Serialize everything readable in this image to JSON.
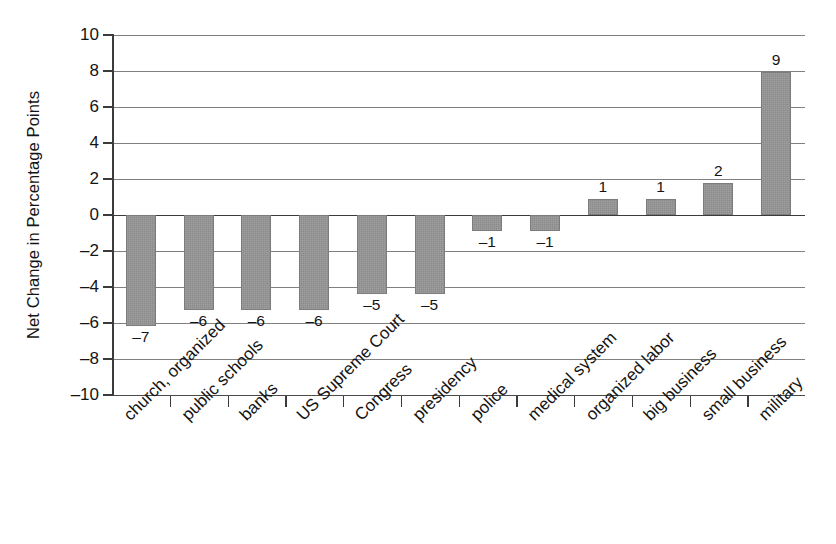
{
  "chart_data": {
    "type": "bar",
    "title": "",
    "xlabel": "",
    "ylabel": "Net Change in Percentage Points",
    "ylim": [
      -10,
      10
    ],
    "ytick_labels": [
      "10",
      "8",
      "6",
      "4",
      "2",
      "0",
      "–2",
      "–4",
      "–6",
      "–8",
      "–10"
    ],
    "ytick_values": [
      10,
      8,
      6,
      4,
      2,
      0,
      -2,
      -4,
      -6,
      -8,
      -10
    ],
    "grid": "horizontal",
    "legend": "none",
    "bar_color": "#8b8b8b",
    "categories": [
      "church, organized",
      "public schools",
      "banks",
      "US Supreme Court",
      "Congress",
      "presidency",
      "police",
      "medical system",
      "organized labor",
      "big business",
      "small business",
      "military"
    ],
    "values": [
      -7,
      -6,
      -6,
      -6,
      -5,
      -5,
      -1,
      -1,
      1,
      1,
      2,
      9
    ],
    "value_labels": [
      "–7",
      "–6",
      "–6",
      "–6",
      "–5",
      "–5",
      "–1",
      "–1",
      "1",
      "1",
      "2",
      "9"
    ]
  }
}
